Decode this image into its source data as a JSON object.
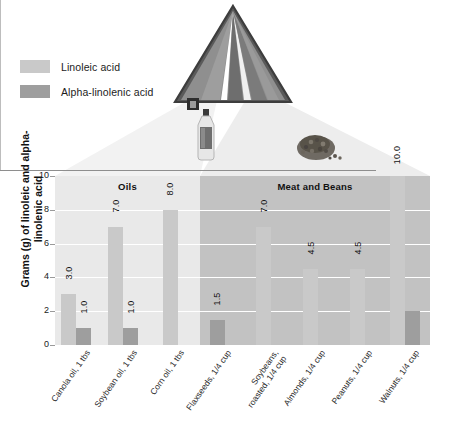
{
  "legend": {
    "items": [
      {
        "label": "Linoleic acid",
        "color": "#c9c9c9",
        "name": "linoleic-acid"
      },
      {
        "label": "Alpha-linolenic acid",
        "color": "#9e9e9e",
        "name": "alpha-linolenic-acid"
      }
    ]
  },
  "graphics": {
    "pyramid_name": "food-pyramid-icon",
    "bottle_name": "oil-bottle-icon",
    "seeds_name": "seeds-pile-icon"
  },
  "chart_data": {
    "type": "bar",
    "title": "",
    "xlabel": "",
    "ylabel": "Grams (g) of linoleic and alpha-linolenic acid",
    "ylim": [
      0,
      10
    ],
    "yticks": [
      "0",
      "2",
      "4",
      "6",
      "8",
      "10"
    ],
    "grid": true,
    "legend_position": "top-left",
    "groups": [
      {
        "name": "Oils",
        "label": "Oils",
        "categories": [
          "Canola oil, 1 tbs",
          "Soybean oil, 1 tbs",
          "Corn oil, 1 tbs"
        ]
      },
      {
        "name": "Meat and Beans",
        "label": "Meat and Beans",
        "categories": [
          "Flaxseeds, 1/4 cup",
          "Soybeans, roasted, 1/4 cup",
          "Almonds, 1/4 cup",
          "Peanuts, 1/4 cup",
          "Walnuts, 1/4 cup"
        ]
      }
    ],
    "categories": [
      "Canola oil, 1 tbs",
      "Soybean oil, 1 tbs",
      "Corn oil, 1 tbs",
      "Flaxseeds, 1/4 cup",
      "Soybeans, roasted, 1/4 cup",
      "Almonds, 1/4 cup",
      "Peanuts, 1/4 cup",
      "Walnuts, 1/4 cup"
    ],
    "series": [
      {
        "name": "Linoleic acid",
        "color": "#c9c9c9",
        "values": [
          3.0,
          7.0,
          8.0,
          null,
          7.0,
          4.5,
          4.5,
          10.0
        ]
      },
      {
        "name": "Alpha-linolenic acid",
        "color": "#9e9e9e",
        "values": [
          1.0,
          1.0,
          null,
          1.5,
          null,
          null,
          null,
          2.0
        ]
      }
    ],
    "data_labels": {
      "Canola oil, 1 tbs": {
        "Linoleic acid": "3.0",
        "Alpha-linolenic acid": "1.0"
      },
      "Soybean oil, 1 tbs": {
        "Linoleic acid": "7.0",
        "Alpha-linolenic acid": "1.0"
      },
      "Corn oil, 1 tbs": {
        "Linoleic acid": "8.0"
      },
      "Flaxseeds, 1/4 cup": {
        "Alpha-linolenic acid": "1.5"
      },
      "Soybeans, roasted, 1/4 cup": {
        "Linoleic acid": "7.0"
      },
      "Almonds, 1/4 cup": {
        "Linoleic acid": "4.5"
      },
      "Peanuts, 1/4 cup": {
        "Linoleic acid": "4.5"
      },
      "Walnuts, 1/4 cup": {
        "Linoleic acid": "10.0"
      }
    },
    "xtick_lines": [
      [
        "Canola oil, 1 tbs"
      ],
      [
        "Soybean oil, 1 tbs"
      ],
      [
        "Corn oil, 1 tbs"
      ],
      [
        "Flaxseeds, 1/4 cup"
      ],
      [
        "Soybeans,",
        "roasted, 1/4 cup"
      ],
      [
        "Almonds, 1/4 cup"
      ],
      [
        "Peanuts, 1/4 cup"
      ],
      [
        "Walnuts, 1/4 cup"
      ]
    ]
  }
}
